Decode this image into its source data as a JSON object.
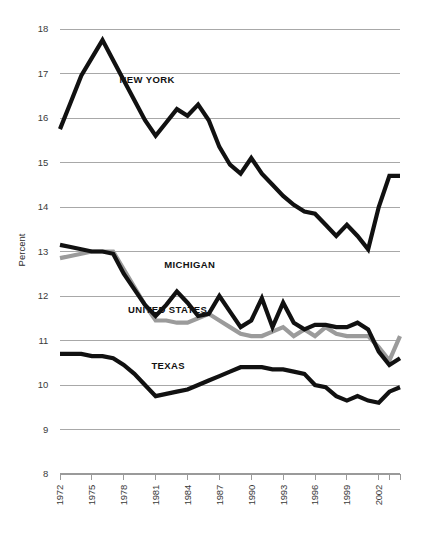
{
  "chart_data": {
    "type": "line",
    "title": "",
    "subtitle": "",
    "xlabel": "",
    "ylabel": "Percent",
    "ylim": [
      8,
      18
    ],
    "xlim": [
      1972,
      2004
    ],
    "grid": true,
    "legend_position": "inline-labels",
    "y_ticks": [
      "18",
      "17",
      "16",
      "15",
      "14",
      "13",
      "12",
      "11",
      "10",
      "9",
      "8"
    ],
    "x_ticks": [
      "1972",
      "1975",
      "1978",
      "1981",
      "1984",
      "1987",
      "1990",
      "1993",
      "1996",
      "1999",
      "2002"
    ],
    "x": [
      1972,
      1973,
      1974,
      1975,
      1976,
      1977,
      1978,
      1979,
      1980,
      1981,
      1982,
      1983,
      1984,
      1985,
      1986,
      1987,
      1988,
      1989,
      1990,
      1991,
      1992,
      1993,
      1994,
      1995,
      1996,
      1997,
      1998,
      1999,
      2000,
      2001,
      2002,
      2003,
      2004
    ],
    "series": [
      {
        "name": "NEW YORK",
        "color": "#111111",
        "width": 4.2,
        "label_x": 1977.6,
        "label_y": 16.78,
        "values": [
          15.75,
          16.35,
          16.95,
          17.35,
          17.75,
          17.3,
          16.85,
          16.4,
          15.95,
          15.6,
          15.9,
          16.2,
          16.05,
          16.3,
          15.95,
          15.35,
          14.95,
          14.75,
          15.1,
          14.75,
          14.5,
          14.25,
          14.05,
          13.9,
          13.85,
          13.6,
          13.35,
          13.6,
          13.35,
          13.05,
          14.0,
          14.7,
          14.7
        ]
      },
      {
        "name": "MICHIGAN",
        "color": "#111111",
        "width": 4.2,
        "label_x": 1981.8,
        "label_y": 12.63,
        "values": [
          13.15,
          13.1,
          13.05,
          13.0,
          13.0,
          12.95,
          12.5,
          12.15,
          11.8,
          11.55,
          11.8,
          12.1,
          11.85,
          11.55,
          11.6,
          12.0,
          11.65,
          11.3,
          11.45,
          11.95,
          11.3,
          11.85,
          11.4,
          11.25,
          11.35,
          11.35,
          11.3,
          11.3,
          11.4,
          11.25,
          10.75,
          10.45,
          10.6
        ]
      },
      {
        "name": "UNITED STATES",
        "color": "#9b9b9b",
        "width": 4.2,
        "label_x": 1978.4,
        "label_y": 11.62,
        "values": [
          12.85,
          12.9,
          12.95,
          13.0,
          13.0,
          13.0,
          12.6,
          12.2,
          11.8,
          11.45,
          11.45,
          11.4,
          11.4,
          11.5,
          11.6,
          11.45,
          11.3,
          11.15,
          11.1,
          11.1,
          11.2,
          11.3,
          11.1,
          11.25,
          11.1,
          11.3,
          11.15,
          11.1,
          11.1,
          11.1,
          10.85,
          10.55,
          11.1
        ]
      },
      {
        "name": "TEXAS",
        "color": "#111111",
        "width": 4.2,
        "label_x": 1980.6,
        "label_y": 10.37,
        "values": [
          10.7,
          10.7,
          10.7,
          10.65,
          10.65,
          10.6,
          10.45,
          10.25,
          10.0,
          9.75,
          9.8,
          9.85,
          9.9,
          10.0,
          10.1,
          10.2,
          10.3,
          10.4,
          10.4,
          10.4,
          10.35,
          10.35,
          10.3,
          10.25,
          10.0,
          9.95,
          9.75,
          9.65,
          9.75,
          9.65,
          9.6,
          9.85,
          9.95
        ]
      }
    ]
  }
}
